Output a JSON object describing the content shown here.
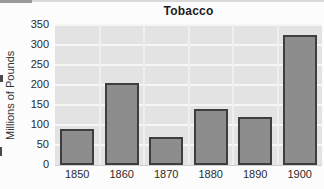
{
  "chart": {
    "title": "Tobacco",
    "ylabel": "Millions of Pounds"
  },
  "chart_data": {
    "type": "bar",
    "title": "Tobacco",
    "xlabel": "",
    "ylabel": "Millions of Pounds",
    "categories": [
      "1850",
      "1860",
      "1870",
      "1880",
      "1890",
      "1900"
    ],
    "values": [
      90,
      205,
      70,
      140,
      120,
      325
    ],
    "ylim": [
      0,
      350
    ],
    "yticks": [
      0,
      50,
      100,
      150,
      200,
      250,
      300,
      350
    ],
    "grid": true,
    "legend": "none",
    "colors": {
      "bar_fill": "#8d8d8d",
      "bar_border": "#3e3e3e",
      "plot_background": "#e3e3e3",
      "gridline": "#f6f6f6",
      "text": "#2b2b2b",
      "page_background": "#fcfcfc"
    }
  }
}
